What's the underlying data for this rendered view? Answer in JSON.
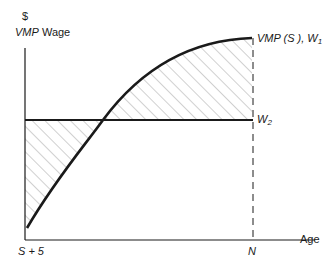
{
  "diagram": {
    "y_axis": {
      "unit_label": "$",
      "label_italic": "VMP",
      "label_plain": "Wage"
    },
    "x_axis": {
      "label": "Age",
      "start_tick": "S + 5",
      "end_tick": "N"
    },
    "curves": {
      "vmp": {
        "label_italic": "VMP (S ),",
        "label_w": "W",
        "label_sub": "1"
      },
      "w2": {
        "label_w": "W",
        "label_sub": "2"
      }
    },
    "colors": {
      "line": "#1a1a1a",
      "hatch": "#8a8a8a",
      "background": "#ffffff"
    }
  }
}
